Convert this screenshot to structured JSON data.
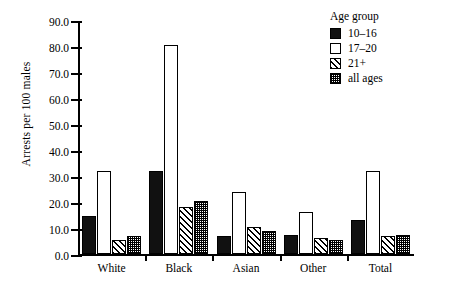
{
  "chart_data": {
    "type": "bar",
    "title": "",
    "xlabel": "",
    "ylabel": "Arrests per 100 males",
    "ylim": [
      0,
      90
    ],
    "ytick_step": 10,
    "ytick_labels": [
      "0.0",
      "10.0",
      "20.0",
      "30.0",
      "40.0",
      "50.0",
      "60.0",
      "70.0",
      "80.0",
      "90.0"
    ],
    "ytick_values": [
      0,
      10,
      20,
      30,
      40,
      50,
      60,
      70,
      80,
      90
    ],
    "grid": false,
    "legend_position": "top-right",
    "legend_title": "Age group",
    "categories": [
      "White",
      "Black",
      "Asian",
      "Other",
      "Total"
    ],
    "series": [
      {
        "name": "10–16",
        "pattern": "solid",
        "values": [
          14.5,
          32.0,
          7.0,
          7.5,
          13.0
        ]
      },
      {
        "name": "17–20",
        "pattern": "open",
        "values": [
          32.0,
          80.5,
          24.0,
          16.0,
          32.0
        ]
      },
      {
        "name": "21+",
        "pattern": "hatch",
        "values": [
          5.5,
          18.0,
          10.5,
          6.0,
          7.0
        ]
      },
      {
        "name": "all ages",
        "pattern": "dot",
        "values": [
          7.0,
          20.5,
          9.0,
          5.5,
          7.5
        ]
      }
    ]
  }
}
